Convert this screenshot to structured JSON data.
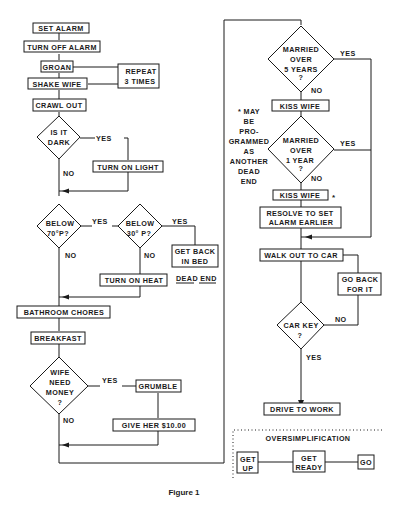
{
  "figure": {
    "caption": "Figure 1",
    "left_column": {
      "set_alarm": "SET ALARM",
      "turn_off_alarm": "TURN OFF ALARM",
      "groan": "GROAN",
      "shake_wife": "SHAKE WIFE",
      "repeat": [
        "REPEAT",
        "3 TIMES"
      ],
      "crawl_out": "CRAWL OUT",
      "is_it_dark": [
        "IS IT",
        "DARK"
      ],
      "is_it_dark_yes": "YES",
      "is_it_dark_no": "NO",
      "turn_on_light": "TURN ON LIGHT",
      "below_70": [
        "BELOW",
        "70°P?"
      ],
      "below_70_yes": "YES",
      "below_70_no": "NO",
      "below_30": [
        "BELOW",
        "30° P?"
      ],
      "below_30_yes": "YES",
      "below_30_no": "NO",
      "get_back_in_bed": [
        "GET BACK",
        "IN BED"
      ],
      "dead_end": "DEAD END",
      "turn_on_heat": "TURN ON HEAT",
      "bathroom_chores": "BATHROOM CHORES",
      "breakfast": "BREAKFAST",
      "wife_need_money": [
        "WIFE",
        "NEED",
        "MONEY",
        "?"
      ],
      "wife_need_money_yes": "YES",
      "wife_need_money_no": "NO",
      "grumble": "GRUMBLE",
      "give_her": "GIVE HER $10.00"
    },
    "right_column": {
      "married_5": [
        "MARRIED",
        "OVER",
        "5 YEARS",
        "?"
      ],
      "married_5_yes": "YES",
      "married_5_no": "NO",
      "kiss_wife_1": "KISS WIFE",
      "married_1": [
        "MARRIED",
        "OVER",
        "1 YEAR",
        "?"
      ],
      "married_1_yes": "YES",
      "married_1_no": "NO",
      "kiss_wife_2": "KISS WIFE",
      "asterisk": "*",
      "footnote": [
        "* MAY",
        "BE",
        "PRO-",
        "GRAMMED",
        "AS",
        "ANOTHER",
        "DEAD",
        "END"
      ],
      "resolve": [
        "RESOLVE TO SET",
        "ALARM EARLIER"
      ],
      "walk_out": "WALK OUT TO CAR",
      "go_back": [
        "GO BACK",
        "FOR IT"
      ],
      "car_key": [
        "CAR KEY",
        "?"
      ],
      "car_key_yes": "YES",
      "car_key_no": "NO",
      "drive": "DRIVE TO WORK"
    },
    "oversimplification": {
      "title": "OVERSIMPLIFICATION",
      "get_up": [
        "GET",
        "UP"
      ],
      "get_ready": [
        "GET",
        "READY"
      ],
      "go": "GO"
    }
  }
}
